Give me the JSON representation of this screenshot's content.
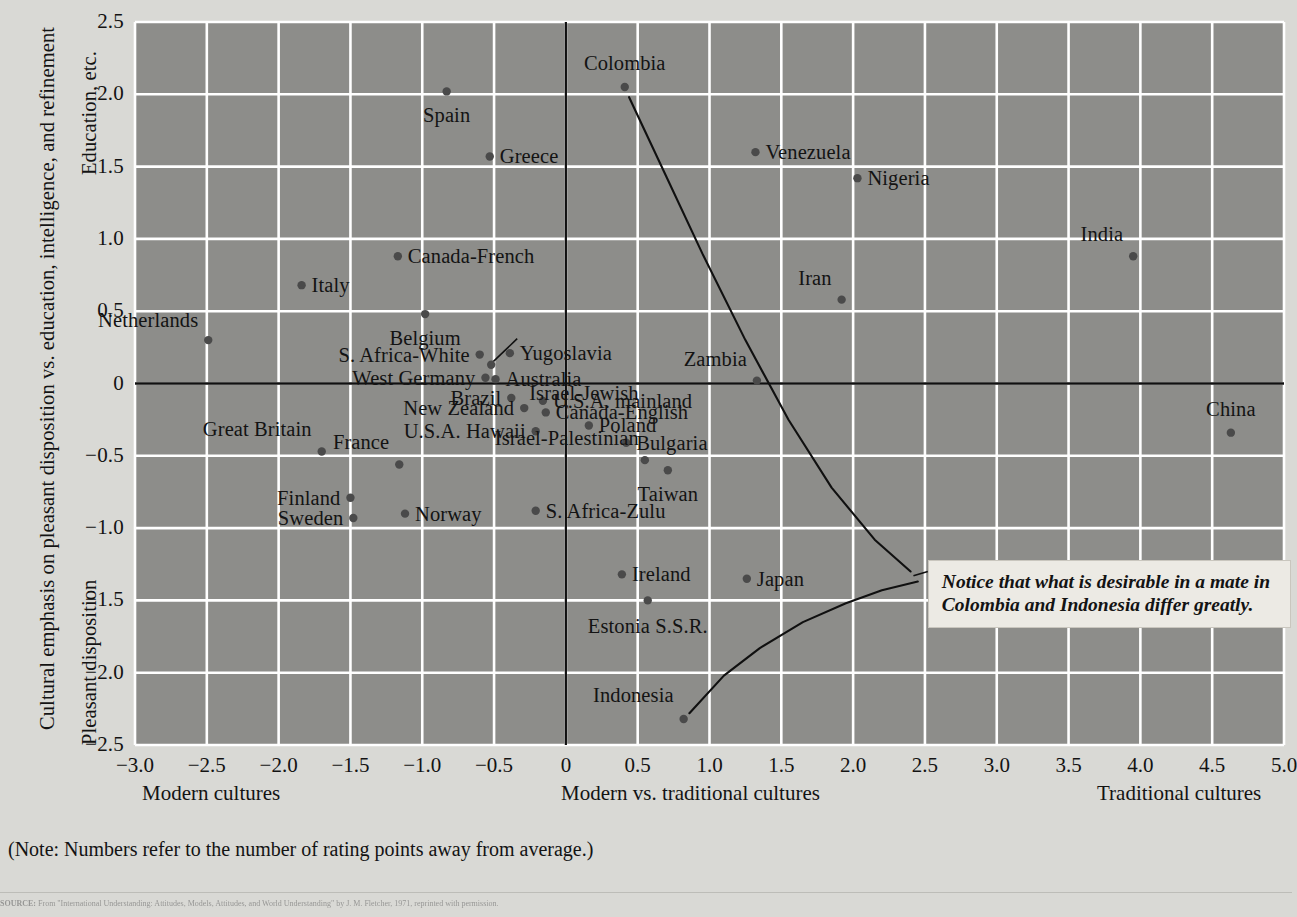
{
  "chart_data": {
    "type": "scatter",
    "title": "",
    "xlabel": "Modern vs. traditional cultures",
    "ylabel_top": "Education, etc.",
    "ylabel_bottom": "Pleasant disposition",
    "ylabel_full": "Cultural emphasis on pleasant disposition vs. education, intelligence, and refinement",
    "xlim": [
      -3.0,
      5.0
    ],
    "ylim": [
      -2.5,
      2.5
    ],
    "xticks": [
      "-3.0",
      "-2.5",
      "-2.0",
      "-1.5",
      "-1.0",
      "-0.5",
      "0",
      "0.5",
      "1.0",
      "1.5",
      "2.0",
      "2.5",
      "3.0",
      "3.5",
      "4.0",
      "4.5",
      "5.0"
    ],
    "xtick_values": [
      -3.0,
      -2.5,
      -2.0,
      -1.5,
      -1.0,
      -0.5,
      0,
      0.5,
      1.0,
      1.5,
      2.0,
      2.5,
      3.0,
      3.5,
      4.0,
      4.5,
      5.0
    ],
    "yticks": [
      "2.5",
      "2.0",
      "1.5",
      "1.0",
      "0.5",
      "0",
      "-0.5",
      "-1.0",
      "-1.5",
      "-2.0",
      "-2.5"
    ],
    "ytick_values": [
      2.5,
      2.0,
      1.5,
      1.0,
      0.5,
      0,
      -0.5,
      -1.0,
      -1.5,
      -2.0,
      -2.5
    ],
    "grid": true,
    "legend": "none",
    "x_axis_left_label": "Modern cultures",
    "x_axis_right_label": "Traditional cultures",
    "plot_bg_color": "#8d8d8a",
    "grid_color": "#ffffff",
    "axis_color": "#101010",
    "point_color": "#4a4a4a",
    "points": [
      {
        "label": "Netherlands",
        "x": -2.49,
        "y": 0.3,
        "pos": "r",
        "dx": -10,
        "dy": -20
      },
      {
        "label": "Great Britain",
        "x": -1.7,
        "y": -0.47,
        "pos": "r",
        "dx": -10,
        "dy": -22
      },
      {
        "label": "Italy",
        "x": -1.84,
        "y": 0.68,
        "pos": "l",
        "dx": 10,
        "dy": 0
      },
      {
        "label": "Spain",
        "x": -0.83,
        "y": 2.02,
        "pos": "c",
        "dx": 0,
        "dy": 24
      },
      {
        "label": "Greece",
        "x": -0.53,
        "y": 1.57,
        "pos": "l",
        "dx": 10,
        "dy": 0
      },
      {
        "label": "Canada-French",
        "x": -1.17,
        "y": 0.88,
        "pos": "l",
        "dx": 10,
        "dy": 0
      },
      {
        "label": "Belgium",
        "x": -0.98,
        "y": 0.48,
        "pos": "c",
        "dx": 0,
        "dy": 24
      },
      {
        "label": "S. Africa-White",
        "x": -0.6,
        "y": 0.2,
        "pos": "r",
        "dx": -10,
        "dy": 0
      },
      {
        "label": "Israel-Jewish",
        "x": -0.52,
        "y": 0.13,
        "pos": "l",
        "dx": 38,
        "dy": 28,
        "leader": true
      },
      {
        "label": "Yugoslavia",
        "x": -0.39,
        "y": 0.21,
        "pos": "l",
        "dx": 10,
        "dy": 0
      },
      {
        "label": "West Germany",
        "x": -0.56,
        "y": 0.04,
        "pos": "r",
        "dx": -10,
        "dy": 0
      },
      {
        "label": "Australia",
        "x": -0.49,
        "y": 0.03,
        "pos": "l",
        "dx": 10,
        "dy": 0
      },
      {
        "label": "Brazil",
        "x": -0.38,
        "y": -0.1,
        "pos": "r",
        "dx": -10,
        "dy": 0
      },
      {
        "label": "U.S.A. mainland",
        "x": -0.16,
        "y": -0.12,
        "pos": "l",
        "dx": 10,
        "dy": 0
      },
      {
        "label": "New Zealand",
        "x": -0.29,
        "y": -0.17,
        "pos": "r",
        "dx": -10,
        "dy": 0
      },
      {
        "label": "Canada-English",
        "x": -0.14,
        "y": -0.2,
        "pos": "l",
        "dx": 10,
        "dy": 0
      },
      {
        "label": "U.S.A. Hawaii",
        "x": -0.21,
        "y": -0.33,
        "pos": "r",
        "dx": -10,
        "dy": 0
      },
      {
        "label": "Poland",
        "x": 0.16,
        "y": -0.29,
        "pos": "l",
        "dx": 10,
        "dy": 0
      },
      {
        "label": "Bulgaria",
        "x": 0.42,
        "y": -0.41,
        "pos": "l",
        "dx": 10,
        "dy": 0
      },
      {
        "label": "France",
        "x": -1.16,
        "y": -0.56,
        "pos": "r",
        "dx": -10,
        "dy": -22
      },
      {
        "label": "Finland",
        "x": -1.5,
        "y": -0.79,
        "pos": "r",
        "dx": -10,
        "dy": 0
      },
      {
        "label": "Sweden",
        "x": -1.48,
        "y": -0.93,
        "pos": "r",
        "dx": -10,
        "dy": 0
      },
      {
        "label": "Norway",
        "x": -1.12,
        "y": -0.9,
        "pos": "l",
        "dx": 10,
        "dy": 0
      },
      {
        "label": "S. Africa-Zulu",
        "x": -0.21,
        "y": -0.88,
        "pos": "l",
        "dx": 10,
        "dy": 0
      },
      {
        "label": "Israel-Palestinian",
        "x": 0.55,
        "y": -0.53,
        "pos": "r",
        "dx": -6,
        "dy": -22
      },
      {
        "label": "Taiwan",
        "x": 0.71,
        "y": -0.6,
        "pos": "c",
        "dx": 0,
        "dy": 24
      },
      {
        "label": "Zambia",
        "x": 1.33,
        "y": 0.02,
        "pos": "r",
        "dx": -10,
        "dy": -22
      },
      {
        "label": "Colombia",
        "x": 0.41,
        "y": 2.05,
        "pos": "c",
        "dx": 0,
        "dy": -24
      },
      {
        "label": "Venezuela",
        "x": 1.32,
        "y": 1.6,
        "pos": "l",
        "dx": 10,
        "dy": 0
      },
      {
        "label": "Nigeria",
        "x": 2.03,
        "y": 1.42,
        "pos": "l",
        "dx": 10,
        "dy": 0
      },
      {
        "label": "Iran",
        "x": 1.92,
        "y": 0.58,
        "pos": "r",
        "dx": -10,
        "dy": -22
      },
      {
        "label": "India",
        "x": 3.95,
        "y": 0.88,
        "pos": "r",
        "dx": -10,
        "dy": -22
      },
      {
        "label": "China",
        "x": 4.63,
        "y": -0.34,
        "pos": "c",
        "dx": 0,
        "dy": -24
      },
      {
        "label": "Ireland",
        "x": 0.39,
        "y": -1.32,
        "pos": "l",
        "dx": 10,
        "dy": 0
      },
      {
        "label": "Japan",
        "x": 1.26,
        "y": -1.35,
        "pos": "l",
        "dx": 10,
        "dy": 0
      },
      {
        "label": "Estonia S.S.R.",
        "x": 0.57,
        "y": -1.5,
        "pos": "c",
        "dx": 0,
        "dy": 26
      },
      {
        "label": "Indonesia",
        "x": 0.82,
        "y": -2.32,
        "pos": "r",
        "dx": -10,
        "dy": -24
      }
    ],
    "curves": [
      {
        "name": "colombia-curve",
        "points": [
          [
            0.44,
            1.98
          ],
          [
            0.7,
            1.43
          ],
          [
            0.95,
            0.9
          ],
          [
            1.25,
            0.3
          ],
          [
            1.55,
            -0.25
          ],
          [
            1.85,
            -0.72
          ],
          [
            2.15,
            -1.08
          ],
          [
            2.4,
            -1.3
          ]
        ]
      },
      {
        "name": "indonesia-curve",
        "points": [
          [
            0.86,
            -2.28
          ],
          [
            1.1,
            -2.02
          ],
          [
            1.35,
            -1.83
          ],
          [
            1.65,
            -1.65
          ],
          [
            1.95,
            -1.52
          ],
          [
            2.2,
            -1.43
          ],
          [
            2.45,
            -1.37
          ]
        ]
      }
    ],
    "annotation": {
      "name": "callout",
      "text": "Notice that what is desirable in a mate in Colombia and Indonesia differ greatly.",
      "leader_from": [
        2.42,
        -1.33
      ]
    }
  },
  "footer": {
    "note": "(Note: Numbers refer to the number of rating points away from average.)",
    "source_prefix": "SOURCE:",
    "source": "From \"International Understanding: Attitudes, Models, Attitudes, and World Understanding\" by J. M. Fletcher, 1971, reprinted with permission."
  }
}
